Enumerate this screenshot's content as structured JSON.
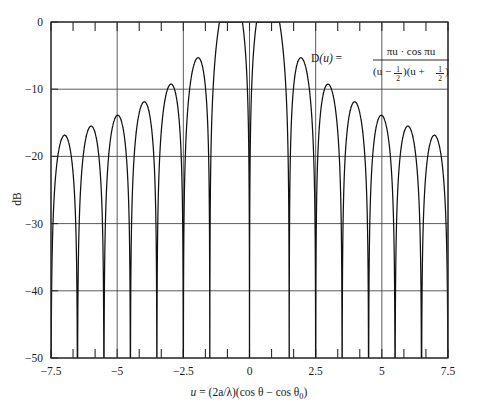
{
  "chart_data": {
    "type": "line",
    "title": "",
    "subtitle": "",
    "xlabel": "u = (2a/λ)(cos θ − cos θ₀)",
    "ylabel": "dB",
    "xlim": [
      -7.5,
      7.5
    ],
    "ylim": [
      -50,
      0
    ],
    "grid": true,
    "legend": null,
    "xticks": [
      -7.5,
      -5,
      -2.5,
      0,
      2.5,
      5,
      7.5
    ],
    "xtick_labels": [
      "−7.5",
      "−5",
      "−2.5",
      "0",
      "2.5",
      "5",
      "7.5"
    ],
    "yticks": [
      0,
      -10,
      -20,
      -30,
      -40,
      -50
    ],
    "ytick_labels": [
      "0",
      "−10",
      "−20",
      "−30",
      "−40",
      "−50"
    ],
    "x_minor_ticks_per_major": 2,
    "formula_text": "D(u) = πu · cos πu / ((u − 1/2)(u + 1/2))",
    "series": [
      {
        "name": "D(u) normalized, dB",
        "function": "20*log10(|pi*u*cos(pi*u)/((u-0.5)*(u+0.5))| / peak)",
        "normalization_peak_value": 3.141592653589793,
        "peak_dB": 0,
        "peak_locations_u": [
          -0.5,
          0.5
        ],
        "null_locations_u": [
          0,
          -1.5,
          1.5,
          -2.5,
          2.5,
          -3.5,
          3.5,
          -4.5,
          4.5,
          -5.5,
          5.5,
          -6.5,
          6.5,
          -7.5,
          7.5
        ],
        "sidelobe_peaks_u": [
          -7.0,
          -6.0,
          -5.0,
          -4.0,
          -3.0,
          -2.0,
          -1.0,
          1.0,
          2.0,
          3.0,
          4.0,
          5.0,
          6.0,
          7.0
        ],
        "sidelobe_peaks_dB": [
          -22.2,
          -21.0,
          -19.6,
          -17.9,
          -15.8,
          -12.9,
          -10.3,
          -10.3,
          -12.9,
          -15.8,
          -17.9,
          -19.6,
          -21.0,
          -22.2
        ]
      }
    ]
  },
  "annotation": {
    "name": "D",
    "of": "(u)",
    "equals": "=",
    "numerator": "πu · cos πu",
    "denominator_left": "(u −",
    "denominator_frac1_num": "1",
    "denominator_frac1_den": "2",
    "denominator_mid": ")(u +",
    "denominator_frac2_num": "1",
    "denominator_frac2_den": "2",
    "denominator_right": ")"
  },
  "xaxis_caption": {
    "var": "u",
    "equals": "=",
    "rest": "(2a/λ)(cos θ − cos θ",
    "subscript": "0",
    "close": ")"
  },
  "colors": {
    "curve": "#111111",
    "grid": "#4a4a4a",
    "frame": "#2b2b2b",
    "background": "#ffffff",
    "text": "#1a1a1a"
  }
}
